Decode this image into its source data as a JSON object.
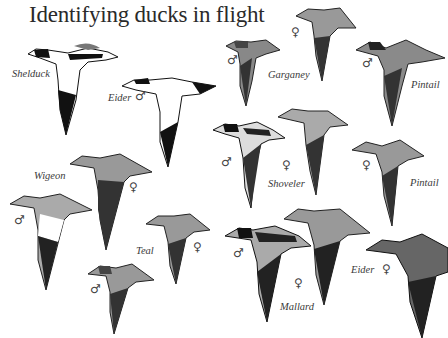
{
  "title": "Identifying ducks in flight",
  "symbols": {
    "male": "♂",
    "female": "♀"
  },
  "birds": [
    {
      "species": "Shelduck",
      "sex": "",
      "label": "Shelduck"
    },
    {
      "species": "Eider",
      "sex": "male",
      "label": "Eider"
    },
    {
      "species": "Garganey",
      "sex": "male",
      "label": "Garganey"
    },
    {
      "species": "Garganey",
      "sex": "female",
      "label": ""
    },
    {
      "species": "Pintail",
      "sex": "male",
      "label": "Pintail"
    },
    {
      "species": "Shoveler",
      "sex": "male",
      "label": "Shoveler"
    },
    {
      "species": "Shoveler",
      "sex": "female",
      "label": ""
    },
    {
      "species": "Pintail",
      "sex": "female",
      "label": "Pintail"
    },
    {
      "species": "Wigeon",
      "sex": "female",
      "label": "Wigeon"
    },
    {
      "species": "Wigeon",
      "sex": "male",
      "label": ""
    },
    {
      "species": "Teal",
      "sex": "female",
      "label": "Teal"
    },
    {
      "species": "Teal",
      "sex": "male",
      "label": ""
    },
    {
      "species": "Mallard",
      "sex": "male",
      "label": ""
    },
    {
      "species": "Mallard",
      "sex": "female",
      "label": "Mallard"
    },
    {
      "species": "Eider",
      "sex": "female",
      "label": "Eider"
    }
  ],
  "labels": {
    "shelduck": "Shelduck",
    "eider_m": "Eider",
    "garganey": "Garganey",
    "pintail_m": "Pintail",
    "shoveler": "Shoveler",
    "pintail_f": "Pintail",
    "wigeon": "Wigeon",
    "teal": "Teal",
    "mallard": "Mallard",
    "eider_f": "Eider"
  }
}
